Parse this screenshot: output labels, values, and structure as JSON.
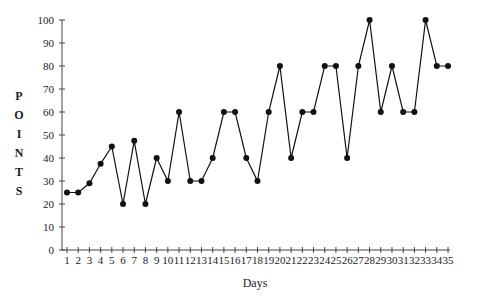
{
  "chart_data": {
    "type": "line",
    "title": "",
    "xlabel": "Days",
    "ylabel": "POINTS",
    "x": [
      1,
      2,
      3,
      4,
      5,
      6,
      7,
      8,
      9,
      10,
      11,
      12,
      13,
      14,
      15,
      16,
      17,
      18,
      19,
      20,
      21,
      22,
      23,
      24,
      25,
      26,
      27,
      28,
      29,
      30,
      31,
      32,
      33,
      34,
      35
    ],
    "series": [
      {
        "name": "Points",
        "values": [
          25,
          25,
          29,
          37.5,
          45,
          20,
          47.5,
          20,
          40,
          30,
          60,
          30,
          30,
          40,
          60,
          60,
          40,
          30,
          60,
          80,
          40,
          60,
          60,
          80,
          80,
          40,
          80,
          100,
          60,
          80,
          60,
          60,
          100,
          80,
          80
        ]
      }
    ],
    "ylim": [
      0,
      100
    ],
    "yticks": [
      0,
      10,
      20,
      30,
      40,
      50,
      60,
      70,
      80,
      90,
      100
    ],
    "xticks": [
      1,
      2,
      3,
      4,
      5,
      6,
      7,
      8,
      9,
      10,
      11,
      12,
      13,
      14,
      15,
      16,
      17,
      18,
      19,
      20,
      21,
      22,
      23,
      24,
      25,
      26,
      27,
      28,
      29,
      30,
      31,
      32,
      33,
      34,
      35
    ],
    "grid": false,
    "legend": "none",
    "marker": "filled-circle",
    "line_color": "#111111"
  }
}
